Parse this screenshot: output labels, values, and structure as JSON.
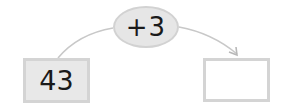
{
  "diagram": {
    "operation": {
      "label": "+3",
      "icon": "plus-operator"
    },
    "start_box": {
      "value": "43"
    },
    "answer_box": {
      "value": ""
    },
    "arrow": {
      "from": "start_box",
      "to": "answer_box",
      "icon": "arrow-head"
    }
  },
  "colors": {
    "oval_fill": "#e6e6e6",
    "oval_border": "#d2d2d2",
    "box_fill": "#e8e8e8",
    "box_border": "#d4d4d4",
    "arc_stroke": "#c8c8c8",
    "text": "#1a1a1a"
  }
}
